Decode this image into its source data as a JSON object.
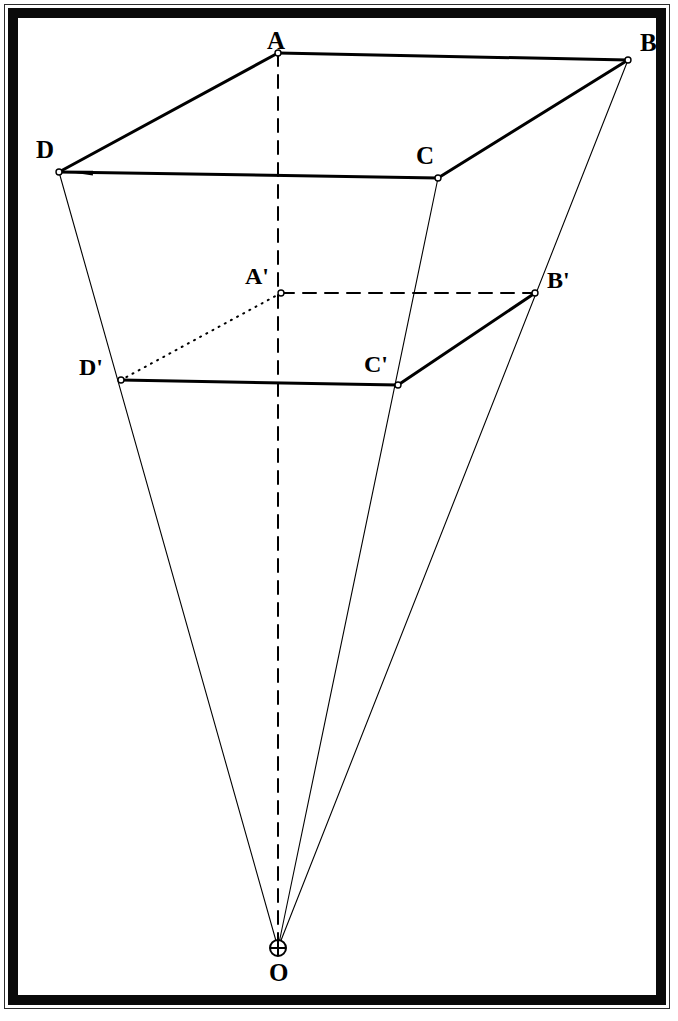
{
  "figure": {
    "background_color": "#ffffff",
    "ink_color": "#000000",
    "frame": {
      "outer_hairline_color": "#2b2b2b",
      "thick_border_color": "#0a0a0a",
      "thick_border_width_px": 10
    },
    "vertices": [
      {
        "id": "A",
        "label": "A",
        "x": 278,
        "y": 53,
        "label_x": 267,
        "label_y": 28,
        "marker": "open-circle"
      },
      {
        "id": "B",
        "label": "B",
        "x": 628,
        "y": 60,
        "label_x": 640,
        "label_y": 30,
        "marker": "open-circle"
      },
      {
        "id": "C",
        "label": "C",
        "x": 438,
        "y": 178,
        "label_x": 416,
        "label_y": 143,
        "marker": "open-circle"
      },
      {
        "id": "D",
        "label": "D",
        "x": 59,
        "y": 172,
        "label_x": 36,
        "label_y": 137,
        "marker": "open-circle"
      },
      {
        "id": "Ap",
        "label": "A'",
        "x": 281,
        "y": 293,
        "label_x": 245,
        "label_y": 264,
        "marker": "open-circle"
      },
      {
        "id": "Bp",
        "label": "B'",
        "x": 535,
        "y": 293,
        "label_x": 547,
        "label_y": 268,
        "marker": "open-circle"
      },
      {
        "id": "Cp",
        "label": "C'",
        "x": 398,
        "y": 385,
        "label_x": 364,
        "label_y": 352,
        "marker": "open-circle"
      },
      {
        "id": "Dp",
        "label": "D'",
        "x": 121,
        "y": 380,
        "label_x": 79,
        "label_y": 355,
        "marker": "open-circle"
      },
      {
        "id": "O",
        "label": "O",
        "x": 278,
        "y": 948,
        "label_x": 269,
        "label_y": 960,
        "marker": "crossed-circle"
      }
    ],
    "edges": [
      {
        "id": "A-B",
        "from": "A",
        "to": "B",
        "style": "solid",
        "weight": "thick",
        "note": "top edge of outer quad"
      },
      {
        "id": "D-A",
        "from": "D",
        "to": "A",
        "style": "solid",
        "weight": "thick",
        "note": "left edge of outer quad"
      },
      {
        "id": "D-C",
        "from": "D",
        "to": "C",
        "style": "solid",
        "weight": "thick",
        "note": "bottom edge of outer quad, arrowhead at D"
      },
      {
        "id": "C-B",
        "from": "C",
        "to": "B",
        "style": "solid",
        "weight": "thick",
        "note": "right edge of outer quad"
      },
      {
        "id": "Ap-Bp",
        "from": "Ap",
        "to": "Bp",
        "style": "dashed",
        "weight": "medium",
        "note": "hidden top edge of inner quad"
      },
      {
        "id": "Ap-Dp",
        "from": "Ap",
        "to": "Dp",
        "style": "dotted",
        "weight": "medium",
        "note": "hidden left edge of inner quad"
      },
      {
        "id": "Dp-Cp",
        "from": "Dp",
        "to": "Cp",
        "style": "solid",
        "weight": "thick",
        "note": "bottom edge of inner quad"
      },
      {
        "id": "Cp-Bp",
        "from": "Cp",
        "to": "Bp",
        "style": "solid",
        "weight": "thick",
        "note": "right edge of inner quad"
      },
      {
        "id": "D-O",
        "from": "D",
        "to": "O",
        "style": "solid",
        "weight": "thin",
        "note": "projection ray through D'"
      },
      {
        "id": "C-O",
        "from": "C",
        "to": "O",
        "style": "solid",
        "weight": "thin",
        "note": "projection ray through C'"
      },
      {
        "id": "B-O",
        "from": "B",
        "to": "O",
        "style": "solid",
        "weight": "thin",
        "note": "projection ray through B'"
      },
      {
        "id": "A-O",
        "from": "A",
        "to": "O",
        "style": "dashed",
        "weight": "medium",
        "note": "central axis through A'"
      }
    ],
    "markers": {
      "open_circle_radius_px": 3,
      "crossed_circle_radius_px": 8,
      "arrowhead_on_edge": "D-C"
    }
  }
}
